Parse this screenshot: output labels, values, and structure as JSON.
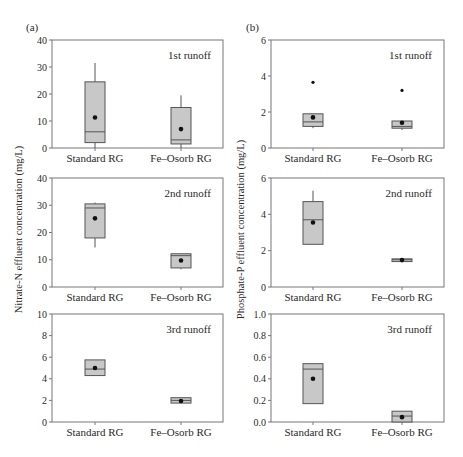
{
  "figure": {
    "panels": [
      {
        "id": "a",
        "label": "(a)",
        "ylabel": "Nitrate-N effluent concentration (mg/L)"
      },
      {
        "id": "b",
        "label": "(b)",
        "ylabel": "Phosphate-P effluent concentration (mg/L)"
      }
    ]
  },
  "colors": {
    "box_fill": "#c8c8c8",
    "line": "#555555",
    "frame": "#777777",
    "mean_dot": "#111111"
  },
  "chart_data": [
    {
      "type": "box",
      "panel": "a",
      "title": "1st runoff",
      "xlabel": "",
      "ylabel": "Nitrate-N effluent concentration (mg/L)",
      "categories": [
        "Standard RG",
        "Fe–Osorb RG"
      ],
      "ylim": [
        0,
        40
      ],
      "yticks": [
        "0",
        "10",
        "20",
        "30",
        "40"
      ],
      "ytick_values": [
        0,
        10,
        20,
        30,
        40
      ],
      "boxes": [
        {
          "category": "Standard RG",
          "whisker_low": 0,
          "q1": 2,
          "median": 6,
          "q3": 24.5,
          "whisker_high": 31.5,
          "mean": 11.3,
          "outliers": []
        },
        {
          "category": "Fe–Osorb RG",
          "whisker_low": 0,
          "q1": 1.5,
          "median": 3,
          "q3": 15,
          "whisker_high": 19.5,
          "mean": 7,
          "outliers": []
        }
      ]
    },
    {
      "type": "box",
      "panel": "a",
      "title": "2nd runoff",
      "xlabel": "",
      "ylabel": "Nitrate-N effluent concentration (mg/L)",
      "categories": [
        "Standard RG",
        "Fe–Osorb RG"
      ],
      "ylim": [
        0,
        40
      ],
      "yticks": [
        "0",
        "10",
        "20",
        "30",
        "40"
      ],
      "ytick_values": [
        0,
        10,
        20,
        30,
        40
      ],
      "boxes": [
        {
          "category": "Standard RG",
          "whisker_low": 14.5,
          "q1": 18,
          "median": 29,
          "q3": 30.5,
          "whisker_high": 31,
          "mean": 25.2,
          "outliers": []
        },
        {
          "category": "Fe–Osorb RG",
          "whisker_low": 6.5,
          "q1": 7,
          "median": 11.5,
          "q3": 12.2,
          "whisker_high": 12.2,
          "mean": 9.7,
          "outliers": []
        }
      ]
    },
    {
      "type": "box",
      "panel": "a",
      "title": "3rd runoff",
      "xlabel": "",
      "ylabel": "Nitrate-N effluent concentration (mg/L)",
      "categories": [
        "Standard RG",
        "Fe–Osorb RG"
      ],
      "ylim": [
        0,
        10
      ],
      "yticks": [
        "0",
        "2",
        "4",
        "6",
        "8",
        "10"
      ],
      "ytick_values": [
        0,
        2,
        4,
        6,
        8,
        10
      ],
      "boxes": [
        {
          "category": "Standard RG",
          "whisker_low": 4.3,
          "q1": 4.3,
          "median": 4.9,
          "q3": 5.75,
          "whisker_high": 5.75,
          "mean": 5.0,
          "outliers": []
        },
        {
          "category": "Fe–Osorb RG",
          "whisker_low": 1.75,
          "q1": 1.75,
          "median": 2.0,
          "q3": 2.25,
          "whisker_high": 2.25,
          "mean": 1.95,
          "outliers": []
        }
      ]
    },
    {
      "type": "box",
      "panel": "b",
      "title": "1st runoff",
      "xlabel": "",
      "ylabel": "Phosphate-P effluent concentration (mg/L)",
      "categories": [
        "Standard RG",
        "Fe–Osorb RG"
      ],
      "ylim": [
        0,
        6
      ],
      "yticks": [
        "0",
        "2",
        "4",
        "6"
      ],
      "ytick_values": [
        0,
        2,
        4,
        6
      ],
      "boxes": [
        {
          "category": "Standard RG",
          "whisker_low": 1.1,
          "q1": 1.2,
          "median": 1.45,
          "q3": 1.9,
          "whisker_high": 1.9,
          "mean": 1.7,
          "outliers": [
            3.65
          ]
        },
        {
          "category": "Fe–Osorb RG",
          "whisker_low": 1.0,
          "q1": 1.1,
          "median": 1.2,
          "q3": 1.5,
          "whisker_high": 1.5,
          "mean": 1.4,
          "outliers": [
            3.2
          ]
        }
      ]
    },
    {
      "type": "box",
      "panel": "b",
      "title": "2nd runoff",
      "xlabel": "",
      "ylabel": "Phosphate-P effluent concentration (mg/L)",
      "categories": [
        "Standard RG",
        "Fe–Osorb RG"
      ],
      "ylim": [
        0,
        6
      ],
      "yticks": [
        "0",
        "2",
        "4",
        "6"
      ],
      "ytick_values": [
        0,
        2,
        4,
        6
      ],
      "boxes": [
        {
          "category": "Standard RG",
          "whisker_low": 2.35,
          "q1": 2.35,
          "median": 3.7,
          "q3": 4.7,
          "whisker_high": 5.3,
          "mean": 3.55,
          "outliers": []
        },
        {
          "category": "Fe–Osorb RG",
          "whisker_low": 1.4,
          "q1": 1.4,
          "median": 1.5,
          "q3": 1.55,
          "whisker_high": 1.55,
          "mean": 1.48,
          "outliers": []
        }
      ]
    },
    {
      "type": "box",
      "panel": "b",
      "title": "3rd runoff",
      "xlabel": "",
      "ylabel": "Phosphate-P effluent concentration (mg/L)",
      "categories": [
        "Standard RG",
        "Fe–Osorb RG"
      ],
      "ylim": [
        0,
        1.0
      ],
      "yticks": [
        "0.0",
        "0.2",
        "0.4",
        "0.6",
        "0.8",
        "1.0"
      ],
      "ytick_values": [
        0,
        0.2,
        0.4,
        0.6,
        0.8,
        1.0
      ],
      "boxes": [
        {
          "category": "Standard RG",
          "whisker_low": 0.17,
          "q1": 0.17,
          "median": 0.49,
          "q3": 0.54,
          "whisker_high": 0.54,
          "mean": 0.4,
          "outliers": []
        },
        {
          "category": "Fe–Osorb RG",
          "whisker_low": 0.0,
          "q1": 0.0,
          "median": 0.055,
          "q3": 0.1,
          "whisker_high": 0.1,
          "mean": 0.045,
          "outliers": []
        }
      ]
    }
  ]
}
